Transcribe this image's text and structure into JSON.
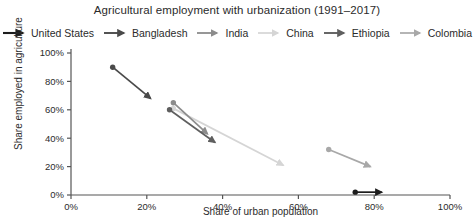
{
  "chart_data": {
    "type": "scatter",
    "title": "Agricultural employment with urbanization (1991–2017)",
    "xlabel": "Share of urban population",
    "ylabel": "Share employed in agriculture",
    "xlim": [
      0,
      100
    ],
    "ylim": [
      0,
      100
    ],
    "xticks": [
      "0%",
      "20%",
      "40%",
      "60%",
      "80%",
      "100%"
    ],
    "xtick_values": [
      0,
      20,
      40,
      60,
      80,
      100
    ],
    "yticks": [
      "0%",
      "20%",
      "40%",
      "60%",
      "80%",
      "100%"
    ],
    "ytick_values": [
      0,
      20,
      40,
      60,
      80,
      100
    ],
    "grid": false,
    "legend_position": "top",
    "marker_note": "Each series is drawn as an arrow from the 1991 point (dot) to the 2017 point (arrowhead)",
    "series": [
      {
        "name": "United States",
        "color": "#1d1d1d",
        "start": {
          "x": 75,
          "y": 2
        },
        "end": {
          "x": 82,
          "y": 2
        }
      },
      {
        "name": "Bangladesh",
        "color": "#4a4a4a",
        "start": {
          "x": 11,
          "y": 90
        },
        "end": {
          "x": 21,
          "y": 68
        }
      },
      {
        "name": "India",
        "color": "#8c8c8c",
        "start": {
          "x": 27,
          "y": 65
        },
        "end": {
          "x": 36,
          "y": 43
        }
      },
      {
        "name": "China",
        "color": "#d5d5d5",
        "start": {
          "x": 27,
          "y": 61
        },
        "end": {
          "x": 56,
          "y": 21
        }
      },
      {
        "name": "Ethiopia",
        "color": "#5f5f5f",
        "start": {
          "x": 26,
          "y": 60
        },
        "end": {
          "x": 38,
          "y": 37
        }
      },
      {
        "name": "Colombia",
        "color": "#a8a8a8",
        "start": {
          "x": 68,
          "y": 32
        },
        "end": {
          "x": 79,
          "y": 20
        }
      }
    ]
  },
  "legend": {
    "items": [
      {
        "label": "United States",
        "color": "#1d1d1d"
      },
      {
        "label": "Bangladesh",
        "color": "#4a4a4a"
      },
      {
        "label": "India",
        "color": "#8c8c8c"
      },
      {
        "label": "China",
        "color": "#d5d5d5"
      },
      {
        "label": "Ethiopia",
        "color": "#5f5f5f"
      },
      {
        "label": "Colombia",
        "color": "#a8a8a8"
      }
    ]
  },
  "axes": {
    "axis_color": "#555555"
  }
}
